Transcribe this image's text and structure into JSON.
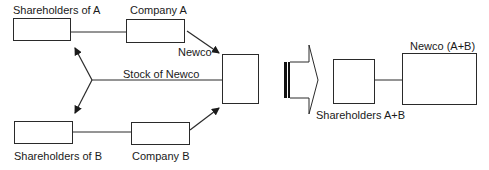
{
  "diagram": {
    "nodes": {
      "shareholders_a": {
        "label": "Shareholders of A"
      },
      "company_a": {
        "label": "Company  A"
      },
      "newco": {
        "label": "Newco"
      },
      "shareholders_b": {
        "label": "Shareholders of B"
      },
      "company_b": {
        "label": "Company B"
      },
      "shareholders_ab": {
        "label": "Shareholders A+B"
      },
      "newco_ab": {
        "label": "Newco (A+B)"
      }
    },
    "edges": {
      "stock_of_newco": {
        "label": "Stock of Newco"
      }
    },
    "colors": {
      "stroke": "#2a2a2a",
      "background": "#ffffff"
    }
  }
}
